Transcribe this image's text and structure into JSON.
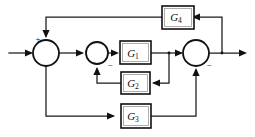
{
  "figure": {
    "kind": "control-system-block-diagram",
    "title": "",
    "background_color": "#ffffff",
    "line_color": "#1a1a1a",
    "width": 255,
    "height": 137
  },
  "blocks": [
    {
      "id": "G1",
      "label": "G",
      "subscript": "1",
      "x": 120,
      "y": 41,
      "w": 31,
      "h": 23
    },
    {
      "id": "G2",
      "label": "G",
      "subscript": "2",
      "x": 121,
      "y": 72,
      "w": 29,
      "h": 22
    },
    {
      "id": "G3",
      "label": "G",
      "subscript": "3",
      "x": 121,
      "y": 104,
      "w": 30,
      "h": 24
    },
    {
      "id": "G4",
      "label": "G",
      "subscript": "4",
      "x": 162,
      "y": 6,
      "w": 28,
      "h": 23
    }
  ],
  "summing_junctions": [
    {
      "id": "sum1",
      "cx": 46,
      "cy": 53,
      "r": 13
    },
    {
      "id": "sum2",
      "cx": 97,
      "cy": 53,
      "r": 11
    },
    {
      "id": "sum3",
      "cx": 196,
      "cy": 53,
      "r": 13
    }
  ],
  "signs": [
    {
      "id": "sum1-plus",
      "symbol": "+",
      "x": 38,
      "y": 40,
      "for": "sum1"
    },
    {
      "id": "sum2-minus",
      "symbol": "−",
      "x": 110,
      "y": 66,
      "for": "sum2"
    },
    {
      "id": "sum3-minus",
      "symbol": "−",
      "x": 209,
      "y": 66,
      "for": "sum3"
    }
  ],
  "ports": {
    "input_label": "",
    "output_label": "",
    "input_x": 9,
    "output_x": 247,
    "signal_y": 53
  },
  "wires": [
    {
      "id": "wire-input-to-sum1",
      "from": "input",
      "to": "sum1"
    },
    {
      "id": "wire-sum1-to-sum2",
      "from": "sum1",
      "to": "sum2"
    },
    {
      "id": "wire-sum2-to-G1",
      "from": "sum2",
      "to": "G1"
    },
    {
      "id": "wire-G1-to-sum3",
      "from": "G1",
      "to": "sum3"
    },
    {
      "id": "wire-G1tap-to-G2",
      "from": "G1-output-tap",
      "to": "G2"
    },
    {
      "id": "wire-G2-to-sum2",
      "from": "G2",
      "to": "sum2"
    },
    {
      "id": "wire-sum1tap-to-G3",
      "from": "sum1-output-tap",
      "to": "G3"
    },
    {
      "id": "wire-G3-to-sum3",
      "from": "G3",
      "to": "sum3"
    },
    {
      "id": "wire-sum3-to-output",
      "from": "sum3",
      "to": "output"
    },
    {
      "id": "wire-outputtap-to-G4",
      "from": "output-tap",
      "to": "G4"
    },
    {
      "id": "wire-G4-to-sum1",
      "from": "G4",
      "to": "sum1"
    }
  ]
}
